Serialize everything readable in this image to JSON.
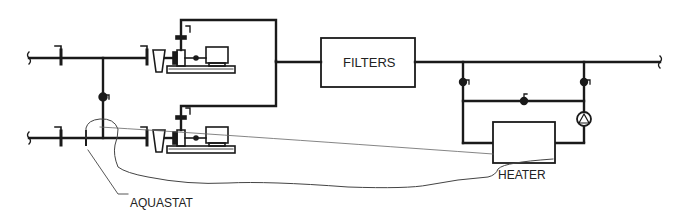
{
  "diagram": {
    "labels": {
      "filters": "FILTERS",
      "heater": "HEATER",
      "aquastat": "AQUASTAT"
    },
    "components": [
      {
        "id": "pump-1",
        "type": "centrifugal-pump-with-motor"
      },
      {
        "id": "pump-2",
        "type": "centrifugal-pump-with-motor"
      },
      {
        "id": "strainer-1",
        "type": "hair-lint-strainer"
      },
      {
        "id": "strainer-2",
        "type": "hair-lint-strainer"
      },
      {
        "id": "filters",
        "type": "filter-bank"
      },
      {
        "id": "heater",
        "type": "heater"
      },
      {
        "id": "circ-pump",
        "type": "inline-circulator"
      },
      {
        "id": "aquastat",
        "type": "temperature-sensor"
      }
    ],
    "colors": {
      "line": "#1a1a1a",
      "thin": "#555555",
      "background": "#ffffff"
    }
  }
}
